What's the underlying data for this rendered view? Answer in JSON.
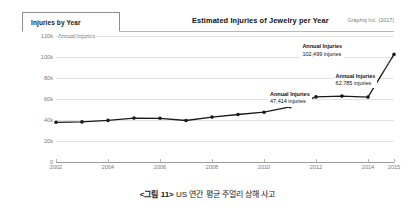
{
  "header": {
    "tab_label": "Injuries by Year",
    "title": "Estimated Injuries of Jewelry per Year",
    "attribution": "Graphiq Inc. (2017)"
  },
  "caption": {
    "figure_number": "<그림 11>",
    "text": "US 연간 평균 주얼리 상해 사고"
  },
  "annotations": [
    {
      "title": "Annual Injuries",
      "value": "47,414 injuries"
    },
    {
      "title": "Annual Injuries",
      "value": "62,785 injuries"
    },
    {
      "title": "Annual Injuries",
      "value": "102,499 injuries"
    }
  ],
  "colors": {
    "line": "#1a1a1a",
    "grid": "#e2e2e2",
    "axis": "#9a9a9a",
    "text": "#7a7a7a"
  },
  "chart_data": {
    "type": "line",
    "title": "Estimated Injuries of Jewelry per Year",
    "xlabel": "",
    "ylabel": "Annual Injuries",
    "ylim": [
      0,
      120000
    ],
    "ytick_labels": [
      "0",
      "20k",
      "40k",
      "60k",
      "80k",
      "100k",
      "120k"
    ],
    "ytick_values": [
      0,
      20000,
      40000,
      60000,
      80000,
      100000,
      120000
    ],
    "xtick_labels": [
      "2002",
      "2004",
      "2006",
      "2008",
      "2010",
      "2012",
      "2014",
      "2015"
    ],
    "xtick_values": [
      2002,
      2004,
      2006,
      2008,
      2010,
      2012,
      2014,
      2015
    ],
    "grid": true,
    "legend": false,
    "x": [
      2002,
      2003,
      2004,
      2005,
      2006,
      2007,
      2008,
      2009,
      2010,
      2011,
      2012,
      2013,
      2014,
      2015
    ],
    "values": [
      37800,
      38200,
      39600,
      41800,
      41600,
      39500,
      42800,
      45200,
      47414,
      52600,
      62000,
      62785,
      61800,
      102499
    ],
    "series": [
      {
        "name": "Annual Injuries",
        "values": [
          37800,
          38200,
          39600,
          41800,
          41600,
          39500,
          42800,
          45200,
          47414,
          52600,
          62000,
          62785,
          61800,
          102499
        ]
      }
    ],
    "labeled_points": [
      {
        "x": 2010,
        "y": 47414,
        "label": "47,414 injuries"
      },
      {
        "x": 2013,
        "y": 62785,
        "label": "62,785 injuries"
      },
      {
        "x": 2015,
        "y": 102499,
        "label": "102,499 injuries"
      }
    ]
  }
}
